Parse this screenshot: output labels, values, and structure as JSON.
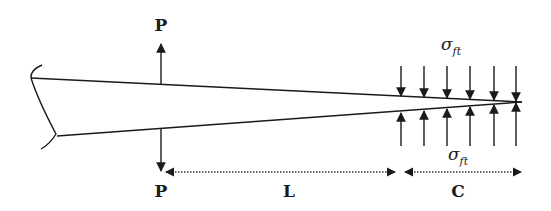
{
  "diagram": {
    "type": "crack-tip cohesive zone (tapered wedge with splitting loads)",
    "labels": {
      "load_top": "P",
      "load_bottom": "P",
      "length_L": "L",
      "length_C": "C",
      "stress_top": "σ",
      "stress_top_sub": "ft",
      "stress_bottom": "σ",
      "stress_bottom_sub": "ft"
    },
    "colors": {
      "line": "#1a1a1a",
      "dotted": "#333333",
      "background": "#ffffff"
    },
    "stress_arrow_count": 6,
    "stress_arrow_x": [
      401,
      424,
      447,
      470,
      494,
      516
    ]
  }
}
